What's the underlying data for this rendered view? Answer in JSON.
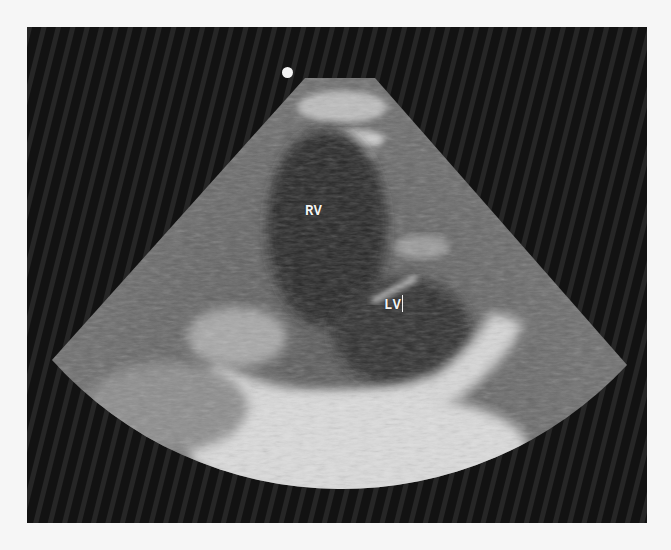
{
  "image": {
    "type": "echocardiogram",
    "view": "parasternal short-axis",
    "background_color": "#f6f6f6",
    "frame_color": "#141414"
  },
  "annotations": {
    "rv_label": "RV",
    "lv_label": "LV"
  },
  "marker": {
    "icon": "orientation-dot-icon",
    "color": "#f4f4f4"
  }
}
